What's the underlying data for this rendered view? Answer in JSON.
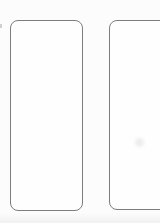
{
  "colors": {
    "background": "#fcfcfc",
    "outline": "#7d7d7d",
    "card_fill": "#fefefe",
    "smudge_color": "#d9d9d9",
    "shade_color": "#eeeeee"
  },
  "panels": [
    {
      "name": "left-card",
      "label": "",
      "clipped": false
    },
    {
      "name": "right-card",
      "label": "",
      "clipped": true
    }
  ]
}
